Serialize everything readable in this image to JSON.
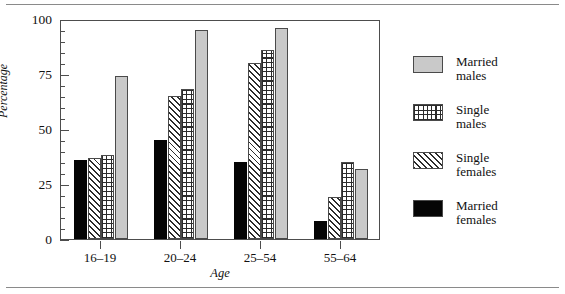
{
  "chart_data": {
    "type": "bar",
    "title": "",
    "subtitle": "",
    "xlabel": "Age",
    "ylabel": "Percentage",
    "categories": [
      "16–19",
      "20–24",
      "25–54",
      "55–64"
    ],
    "ylim": [
      0,
      100
    ],
    "ytick_labels": [
      "0",
      "25",
      "50",
      "75",
      "100"
    ],
    "ytick_values": [
      0,
      25,
      50,
      75,
      100
    ],
    "minor_tick_step": 5,
    "grid": false,
    "legend_position": "right",
    "series": [
      {
        "name": "Married\nfemales",
        "legend_label": "Married\nfemales",
        "pattern": "solid-black",
        "color": "#050505",
        "values": [
          36,
          45,
          35,
          8
        ]
      },
      {
        "name": "Single\nfemales",
        "legend_label": "Single\nfemales",
        "pattern": "diagonal-hatch",
        "color": "#2b2b2b",
        "values": [
          37,
          65,
          80,
          19
        ]
      },
      {
        "name": "Single\nmales",
        "legend_label": "Single\nmales",
        "pattern": "crosshatch",
        "color": "#2b2b2b",
        "values": [
          38,
          68,
          86,
          35
        ]
      },
      {
        "name": "Married\nmales",
        "legend_label": "Married\nmales",
        "pattern": "solid-gray",
        "color": "#c9c9c9",
        "values": [
          74,
          95,
          96,
          32
        ]
      }
    ],
    "legend_order": [
      "Married\nmales",
      "Single\nmales",
      "Single\nfemales",
      "Married\nfemales"
    ]
  },
  "axis": {
    "y_title": "Percentage",
    "x_title": "Age",
    "y_labels": [
      "100",
      "75",
      "50",
      "25",
      "0"
    ],
    "x_labels": [
      "16–19",
      "20–24",
      "25–54",
      "55–64"
    ]
  },
  "legend": {
    "items": [
      {
        "label": "Married\nmales",
        "pattern": "solid-gray"
      },
      {
        "label": "Single\nmales",
        "pattern": "crosshatch"
      },
      {
        "label": "Single\nfemales",
        "pattern": "diagonal-hatch"
      },
      {
        "label": "Married\nfemales",
        "pattern": "solid-black"
      }
    ]
  },
  "colors": {
    "frame": "#4d4d4d",
    "gray_fill": "#c9c9c9",
    "black_fill": "#050505",
    "hatch": "#2b2b2b",
    "rule": "#8a8a8a",
    "background": "#ffffff"
  }
}
